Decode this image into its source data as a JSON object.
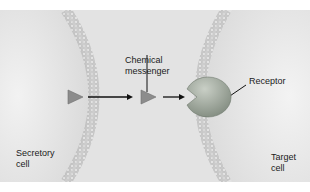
{
  "diagram": {
    "labels": {
      "chemical_messenger_line1": "Chemical",
      "chemical_messenger_line2": "messenger",
      "receptor": "Receptor",
      "secretory_cell_line1": "Secretory",
      "secretory_cell_line2": "cell",
      "target_cell_line1": "Target",
      "target_cell_line2": "cell"
    },
    "colors": {
      "background": "#e3e3e3",
      "cell_fill": "#eeeeee",
      "membrane": "#b5b5b5",
      "messenger": "#8a8a8a",
      "receptor": "#8f9a8f",
      "arrow": "#111111"
    }
  }
}
